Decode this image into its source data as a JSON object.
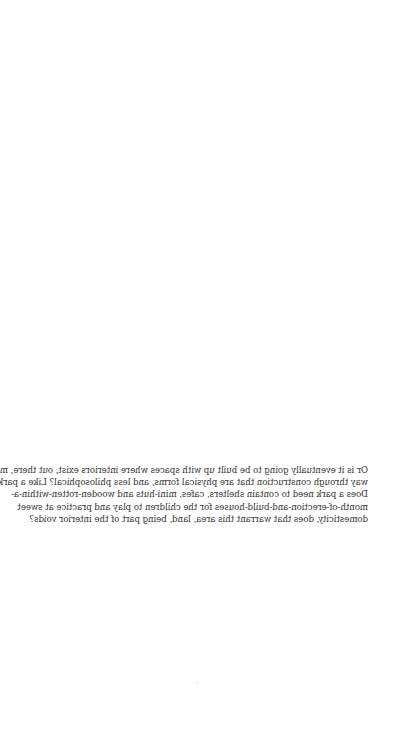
{
  "document": {
    "orientation": "mirrored-horizontal",
    "paragraph": {
      "lines": [
        "Or is it eventually going to be built up with spaces where interiors exist, out there, mid-",
        "way through construction that are physical forms, and less philosophical? Like a park.",
        "Does a park need to contain shelters, cafes, mini-huts and wooden-rotten-within-a-",
        "month-of-erection-and-build-houses for the children to play and practice at sweet",
        "domesticity, does that warrant this area, land, being part of the interior voids?"
      ]
    },
    "colors": {
      "background": "#ffffff",
      "text": "#333333"
    }
  }
}
